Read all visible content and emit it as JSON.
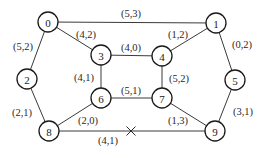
{
  "diagram": {
    "type": "network-graph",
    "colors": {
      "stroke": "#1a1a1a",
      "background": "#ffffff"
    },
    "nodes": [
      {
        "id": "0",
        "label": "0",
        "x": 48,
        "y": 22
      },
      {
        "id": "1",
        "label": "1",
        "x": 216,
        "y": 23
      },
      {
        "id": "2",
        "label": "2",
        "x": 27,
        "y": 79
      },
      {
        "id": "3",
        "label": "3",
        "x": 101,
        "y": 55
      },
      {
        "id": "4",
        "label": "4",
        "x": 162,
        "y": 56
      },
      {
        "id": "5",
        "label": "5",
        "x": 235,
        "y": 80
      },
      {
        "id": "6",
        "label": "6",
        "x": 101,
        "y": 98
      },
      {
        "id": "7",
        "label": "7",
        "x": 162,
        "y": 98
      },
      {
        "id": "8",
        "label": "8",
        "x": 49,
        "y": 131
      },
      {
        "id": "9",
        "label": "9",
        "x": 215,
        "y": 131
      }
    ],
    "edges": [
      {
        "from": "0",
        "to": "1",
        "label": "(5,3)",
        "lx": 131,
        "ly": 13
      },
      {
        "from": "0",
        "to": "2",
        "label": "(5,2)",
        "lx": 23,
        "ly": 46
      },
      {
        "from": "0",
        "to": "3",
        "label": "(4,2)",
        "lx": 86,
        "ly": 34
      },
      {
        "from": "1",
        "to": "4",
        "label": "(1,2)",
        "lx": 178,
        "ly": 34
      },
      {
        "from": "1",
        "to": "5",
        "label": "(0,2)",
        "lx": 242,
        "ly": 44
      },
      {
        "from": "3",
        "to": "4",
        "label": "(4,0)",
        "lx": 131,
        "ly": 47
      },
      {
        "from": "3",
        "to": "6",
        "label": "(4,1)",
        "lx": 84,
        "ly": 77
      },
      {
        "from": "4",
        "to": "7",
        "label": "(5,2)",
        "lx": 179,
        "ly": 78
      },
      {
        "from": "6",
        "to": "7",
        "label": "(5,1)",
        "lx": 131,
        "ly": 90
      },
      {
        "from": "2",
        "to": "8",
        "label": "(2,1)",
        "lx": 22,
        "ly": 112
      },
      {
        "from": "6",
        "to": "8",
        "label": "(2,0)",
        "lx": 88,
        "ly": 120
      },
      {
        "from": "7",
        "to": "9",
        "label": "(1,3)",
        "lx": 178,
        "ly": 120
      },
      {
        "from": "5",
        "to": "9",
        "label": "(3,1)",
        "lx": 243,
        "ly": 111
      },
      {
        "from": "8",
        "to": "9",
        "label": "(4,1)",
        "lx": 108,
        "ly": 140,
        "cut": true,
        "cut_x": 131,
        "cut_y": 131
      }
    ],
    "node_radius": 10
  }
}
